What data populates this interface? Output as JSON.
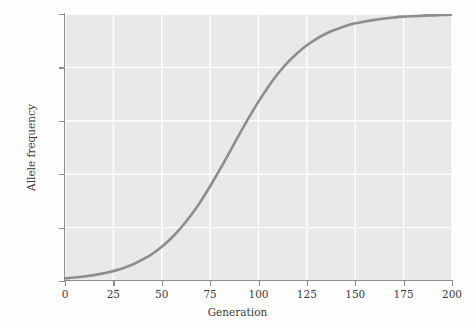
{
  "chart_data": {
    "type": "line",
    "title": "",
    "subtitle": "",
    "xlabel": "Generation",
    "ylabel": "Allele frequency",
    "xlim": [
      0,
      200
    ],
    "ylim": [
      0.0,
      1.0
    ],
    "xticks": [
      0,
      25,
      50,
      75,
      100,
      125,
      150,
      175,
      200
    ],
    "xtick_labels": [
      "0",
      "25",
      "50",
      "75",
      "100",
      "125",
      "150",
      "175",
      "200"
    ],
    "yticks": [
      0.0,
      0.2,
      0.4,
      0.6,
      0.8,
      1.0
    ],
    "ytick_labels": [
      "0.0",
      "0.2",
      "0.4",
      "0.6",
      "0.8",
      "1.0"
    ],
    "grid": true,
    "grid_color": "#ffffff",
    "panel_color": "#e9e9e9",
    "legend": null,
    "legend_position": "none",
    "series": [
      {
        "name": "Allele frequency",
        "color": "#8d8d8d",
        "line_width": 2.6,
        "x": [
          0,
          5,
          10,
          15,
          20,
          25,
          30,
          35,
          40,
          45,
          50,
          55,
          60,
          65,
          70,
          75,
          80,
          85,
          90,
          95,
          100,
          105,
          110,
          115,
          120,
          125,
          130,
          135,
          140,
          145,
          150,
          155,
          160,
          165,
          170,
          175,
          180,
          185,
          190,
          195,
          200
        ],
        "y": [
          0.01,
          0.013,
          0.017,
          0.022,
          0.029,
          0.037,
          0.048,
          0.062,
          0.08,
          0.101,
          0.128,
          0.161,
          0.2,
          0.245,
          0.297,
          0.355,
          0.417,
          0.482,
          0.548,
          0.612,
          0.672,
          0.727,
          0.776,
          0.818,
          0.853,
          0.883,
          0.907,
          0.927,
          0.942,
          0.955,
          0.965,
          0.972,
          0.978,
          0.983,
          0.987,
          0.99,
          0.992,
          0.994,
          0.995,
          0.996,
          0.997
        ]
      }
    ]
  }
}
